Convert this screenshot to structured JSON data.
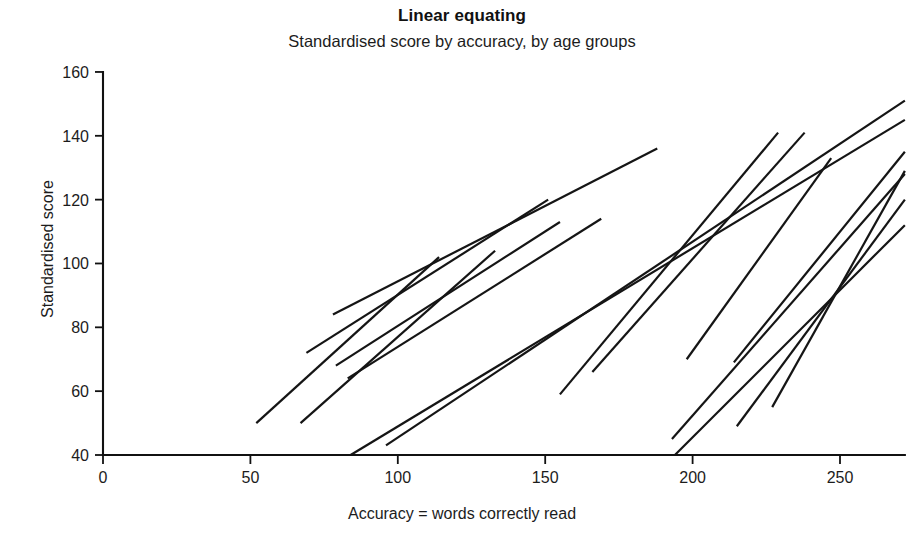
{
  "chart_data": {
    "type": "line",
    "title": "Linear equating",
    "subtitle": "Standardised score by accuracy, by age groups",
    "xlabel": "Accuracy = words correctly read",
    "ylabel": "Standardised score",
    "xlim": [
      0,
      272
    ],
    "ylim": [
      36,
      162
    ],
    "xticks": [
      0,
      50,
      100,
      150,
      200,
      250
    ],
    "xtick_labels": [
      "0",
      "50",
      "100",
      "150",
      "200",
      "250"
    ],
    "yticks": [
      40,
      60,
      80,
      100,
      120,
      140,
      160
    ],
    "ytick_labels": [
      "40",
      "60",
      "80",
      "100",
      "120",
      "140",
      "160"
    ],
    "grid": false,
    "legend": "none",
    "line_color": "#151515",
    "series": [
      {
        "name": "age-group-1",
        "x": [
          52,
          114
        ],
        "y": [
          50,
          102
        ]
      },
      {
        "name": "age-group-2",
        "x": [
          67,
          133
        ],
        "y": [
          50,
          104
        ]
      },
      {
        "name": "age-group-3",
        "x": [
          69,
          151
        ],
        "y": [
          72,
          120
        ]
      },
      {
        "name": "age-group-4",
        "x": [
          79,
          155
        ],
        "y": [
          68,
          113
        ]
      },
      {
        "name": "age-group-5",
        "x": [
          83,
          169
        ],
        "y": [
          64,
          114
        ]
      },
      {
        "name": "age-group-6",
        "x": [
          78,
          188
        ],
        "y": [
          84,
          136
        ]
      },
      {
        "name": "age-group-7",
        "x": [
          84,
          272
        ],
        "y": [
          40,
          145
        ]
      },
      {
        "name": "age-group-8",
        "x": [
          96,
          272
        ],
        "y": [
          43,
          151
        ]
      },
      {
        "name": "age-group-9",
        "x": [
          155,
          229
        ],
        "y": [
          59,
          141
        ]
      },
      {
        "name": "age-group-10",
        "x": [
          166,
          238
        ],
        "y": [
          66,
          141
        ]
      },
      {
        "name": "age-group-11",
        "x": [
          194,
          272
        ],
        "y": [
          40,
          112
        ]
      },
      {
        "name": "age-group-12",
        "x": [
          198,
          247
        ],
        "y": [
          70,
          133
        ]
      },
      {
        "name": "age-group-13",
        "x": [
          214,
          272
        ],
        "y": [
          69,
          135
        ]
      },
      {
        "name": "age-group-14",
        "x": [
          215,
          272
        ],
        "y": [
          49,
          120
        ]
      },
      {
        "name": "age-group-15",
        "x": [
          193,
          272
        ],
        "y": [
          45,
          128
        ]
      },
      {
        "name": "age-group-16",
        "x": [
          227,
          272
        ],
        "y": [
          55,
          129
        ]
      }
    ]
  }
}
